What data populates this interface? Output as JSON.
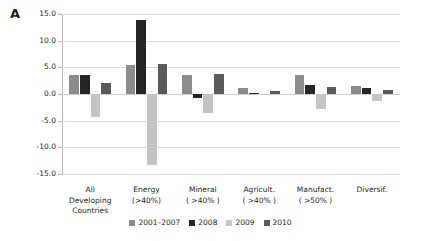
{
  "panel_label": "A",
  "chart_data": {
    "type": "bar",
    "title": "",
    "subtitle": "",
    "xlabel": "",
    "ylabel": "",
    "ylim": [
      -15.0,
      15.0
    ],
    "yticks": [
      15.0,
      10.0,
      5.0,
      0.0,
      -5.0,
      -10.0,
      -15.0
    ],
    "ytick_labels": [
      "15.0",
      "10.0",
      "5.0",
      "0.0",
      "-5.0",
      "-10.0",
      "-15.0"
    ],
    "grid": true,
    "legend_position": "bottom",
    "categories": [
      "All\nDeveloping\nCountries",
      "Energy\n(>40%)",
      "Mineral\n( >40% )",
      "Agricult.\n( >40% )",
      "Manufact.\n( >50% )",
      "Diversif."
    ],
    "category_labels_flat": [
      "All Developing Countries",
      "Energy (>40%)",
      "Mineral ( >40% )",
      "Agricult. ( >40% )",
      "Manufact. ( >50% )",
      "Diversif."
    ],
    "series": [
      {
        "name": "2001–2007",
        "color": "#8c8c8c",
        "values": [
          3.6,
          5.5,
          3.5,
          1.2,
          3.5,
          1.5
        ]
      },
      {
        "name": "2008",
        "color": "#262626",
        "values": [
          3.5,
          13.8,
          -0.7,
          0.1,
          1.7,
          1.2
        ]
      },
      {
        "name": "2009",
        "color": "#c4c4c4",
        "values": [
          -4.3,
          -13.4,
          -3.6,
          0.0,
          -2.8,
          -1.3
        ]
      },
      {
        "name": "2010",
        "color": "#5a5a5a",
        "values": [
          2.1,
          5.6,
          3.7,
          0.6,
          1.4,
          0.7
        ]
      }
    ]
  },
  "colors": {
    "background": "#ffffff",
    "text": "#231f20",
    "gridline": "#d8d8d8",
    "axis": "#b8b8b8"
  }
}
